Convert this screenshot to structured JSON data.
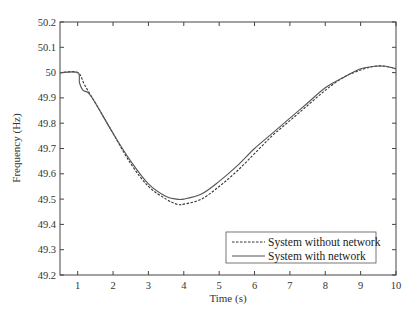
{
  "chart_data": {
    "type": "line",
    "title": "",
    "xlabel": "Time (s)",
    "ylabel": "Frequency (Hz)",
    "xlim": [
      0.5,
      10
    ],
    "ylim": [
      49.2,
      50.2
    ],
    "xticks": [
      1,
      2,
      3,
      4,
      5,
      6,
      7,
      8,
      9,
      10
    ],
    "yticks": [
      49.2,
      49.3,
      49.4,
      49.5,
      49.6,
      49.7,
      49.8,
      49.9,
      50,
      50.1,
      50.2
    ],
    "ytick_labels": [
      "49.2",
      "49.3",
      "49.4",
      "49.5",
      "49.6",
      "49.7",
      "49.8",
      "49.9",
      "50",
      "50.1",
      "50.2"
    ],
    "grid": false,
    "legend_position": "lower right",
    "series": [
      {
        "name": "System without network",
        "style": "dashed",
        "color": "#333333",
        "x": [
          0.5,
          1.0,
          1.2,
          1.5,
          2.0,
          2.5,
          3.0,
          3.5,
          3.8,
          4.0,
          4.5,
          5.0,
          5.5,
          6.0,
          6.5,
          7.0,
          7.5,
          8.0,
          8.5,
          9.0,
          9.4,
          9.7,
          10.0
        ],
        "y": [
          50.0,
          50.0,
          49.95,
          49.88,
          49.76,
          49.64,
          49.55,
          49.5,
          49.48,
          49.48,
          49.5,
          49.55,
          49.61,
          49.68,
          49.75,
          49.81,
          49.87,
          49.93,
          49.98,
          50.01,
          50.025,
          50.025,
          50.015
        ]
      },
      {
        "name": "System with network",
        "style": "solid",
        "color": "#555555",
        "x": [
          0.5,
          1.0,
          1.05,
          1.15,
          1.3,
          1.5,
          2.0,
          2.5,
          3.0,
          3.5,
          3.8,
          4.0,
          4.5,
          5.0,
          5.5,
          6.0,
          6.5,
          7.0,
          7.5,
          8.0,
          8.5,
          9.0,
          9.4,
          9.7,
          10.0
        ],
        "y": [
          50.0,
          50.0,
          49.96,
          49.93,
          49.92,
          49.88,
          49.76,
          49.65,
          49.56,
          49.51,
          49.5,
          49.5,
          49.52,
          49.57,
          49.63,
          49.7,
          49.76,
          49.82,
          49.88,
          49.94,
          49.98,
          50.015,
          50.025,
          50.025,
          50.015
        ]
      }
    ]
  },
  "legend": {
    "items": [
      {
        "label": "System without network",
        "style": "dashed"
      },
      {
        "label": "System with network",
        "style": "solid"
      }
    ]
  },
  "axes": {
    "xlabel": "Time (s)",
    "ylabel": "Frequency (Hz)"
  }
}
